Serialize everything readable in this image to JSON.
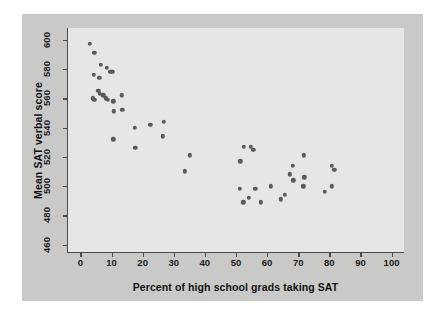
{
  "chart_data": {
    "type": "scatter",
    "title": "",
    "xlabel": "Percent of high school grads taking SAT",
    "ylabel": "Mean SAT verbal score",
    "xlim": [
      -4,
      104
    ],
    "ylim": [
      455,
      608
    ],
    "xticks": [
      0,
      10,
      20,
      30,
      40,
      50,
      60,
      70,
      80,
      90,
      100
    ],
    "yticks": [
      460,
      480,
      500,
      520,
      540,
      560,
      580,
      600
    ],
    "grid": false,
    "legend": null,
    "marker_color": "#5b5b5b",
    "plot_background": "#e6e6e4",
    "panel_background": "#c9c9c7",
    "points": [
      {
        "x": 3.0,
        "y": 597
      },
      {
        "x": 4.5,
        "y": 591
      },
      {
        "x": 6.5,
        "y": 583
      },
      {
        "x": 8.5,
        "y": 581
      },
      {
        "x": 9.6,
        "y": 578
      },
      {
        "x": 10.2,
        "y": 578
      },
      {
        "x": 4.2,
        "y": 576
      },
      {
        "x": 6.0,
        "y": 574
      },
      {
        "x": 5.8,
        "y": 565
      },
      {
        "x": 6.2,
        "y": 563
      },
      {
        "x": 7.4,
        "y": 562
      },
      {
        "x": 13.2,
        "y": 562
      },
      {
        "x": 4.0,
        "y": 560
      },
      {
        "x": 4.4,
        "y": 559
      },
      {
        "x": 8.2,
        "y": 560
      },
      {
        "x": 8.8,
        "y": 559
      },
      {
        "x": 10.6,
        "y": 558
      },
      {
        "x": 10.8,
        "y": 551
      },
      {
        "x": 13.4,
        "y": 552
      },
      {
        "x": 17.4,
        "y": 540
      },
      {
        "x": 22.4,
        "y": 542
      },
      {
        "x": 26.8,
        "y": 544
      },
      {
        "x": 26.4,
        "y": 534
      },
      {
        "x": 10.6,
        "y": 532
      },
      {
        "x": 17.6,
        "y": 526
      },
      {
        "x": 35.2,
        "y": 521
      },
      {
        "x": 33.6,
        "y": 510
      },
      {
        "x": 51.4,
        "y": 517
      },
      {
        "x": 52.6,
        "y": 527
      },
      {
        "x": 54.8,
        "y": 527
      },
      {
        "x": 55.6,
        "y": 525
      },
      {
        "x": 51.2,
        "y": 498
      },
      {
        "x": 52.4,
        "y": 489
      },
      {
        "x": 54.2,
        "y": 492
      },
      {
        "x": 56.2,
        "y": 498
      },
      {
        "x": 58.0,
        "y": 489
      },
      {
        "x": 61.2,
        "y": 500
      },
      {
        "x": 64.4,
        "y": 491
      },
      {
        "x": 65.6,
        "y": 494
      },
      {
        "x": 67.2,
        "y": 508
      },
      {
        "x": 68.2,
        "y": 514
      },
      {
        "x": 68.4,
        "y": 504
      },
      {
        "x": 71.8,
        "y": 521
      },
      {
        "x": 72.0,
        "y": 506
      },
      {
        "x": 71.6,
        "y": 500
      },
      {
        "x": 78.6,
        "y": 496
      },
      {
        "x": 80.8,
        "y": 514
      },
      {
        "x": 81.6,
        "y": 511
      },
      {
        "x": 80.8,
        "y": 500
      }
    ]
  }
}
